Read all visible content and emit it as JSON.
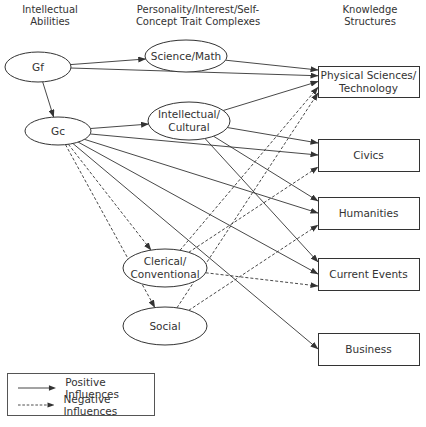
{
  "headers": {
    "abilities": [
      "Intellectual",
      "Abilities"
    ],
    "traits": [
      "Personality/Interest/Self-",
      "Concept Trait Complexes"
    ],
    "knowledge": [
      "Knowledge",
      "Structures"
    ]
  },
  "nodes": {
    "gf": {
      "label": "Gf",
      "shape": "ellipse",
      "cx": 38,
      "cy": 67,
      "rx": 33,
      "ry": 15
    },
    "gc": {
      "label": "Gc",
      "shape": "ellipse",
      "cx": 58,
      "cy": 131,
      "rx": 33,
      "ry": 14
    },
    "science_math": {
      "label": "Science/Math",
      "shape": "ellipse",
      "cx": 186,
      "cy": 56,
      "rx": 41,
      "ry": 16
    },
    "intellectual_cultural": {
      "label": "Intellectual/\nCultural",
      "line1": "Intellectual/",
      "line2": "Cultural",
      "shape": "ellipse",
      "cx": 189,
      "cy": 121,
      "rx": 41,
      "ry": 19
    },
    "clerical_conventional": {
      "label": "Clerical/\nConventional",
      "line1": "Clerical/",
      "line2": "Conventional",
      "shape": "ellipse",
      "cx": 165,
      "cy": 268,
      "rx": 42,
      "ry": 19
    },
    "social": {
      "label": "Social",
      "shape": "ellipse",
      "cx": 165,
      "cy": 326,
      "rx": 42,
      "ry": 19
    },
    "physical_sciences": {
      "label": "Physical Sciences/\nTechnology",
      "line1": "Physical Sciences/",
      "line2": "Technology",
      "shape": "box",
      "x": 318,
      "y": 66,
      "w": 101,
      "h": 31
    },
    "civics": {
      "label": "Civics",
      "shape": "box",
      "x": 318,
      "y": 139,
      "w": 101,
      "h": 32
    },
    "humanities": {
      "label": "Humanities",
      "shape": "box",
      "x": 318,
      "y": 197,
      "w": 101,
      "h": 32
    },
    "current_events": {
      "label": "Current Events",
      "shape": "box",
      "x": 318,
      "y": 258,
      "w": 101,
      "h": 32
    },
    "business": {
      "label": "Business",
      "shape": "box",
      "x": 318,
      "y": 333,
      "w": 101,
      "h": 32
    }
  },
  "edges": [
    {
      "from": "gf",
      "to": "science_math",
      "type": "positive"
    },
    {
      "from": "gf",
      "to": "physical_sciences",
      "type": "positive"
    },
    {
      "from": "gf",
      "to": "gc",
      "type": "positive"
    },
    {
      "from": "science_math",
      "to": "physical_sciences",
      "type": "positive"
    },
    {
      "from": "gc",
      "to": "intellectual_cultural",
      "type": "positive"
    },
    {
      "from": "gc",
      "to": "civics",
      "type": "positive"
    },
    {
      "from": "gc",
      "to": "humanities",
      "type": "positive"
    },
    {
      "from": "gc",
      "to": "current_events",
      "type": "positive"
    },
    {
      "from": "gc",
      "to": "business",
      "type": "positive"
    },
    {
      "from": "intellectual_cultural",
      "to": "physical_sciences",
      "type": "positive"
    },
    {
      "from": "intellectual_cultural",
      "to": "civics",
      "type": "positive"
    },
    {
      "from": "intellectual_cultural",
      "to": "humanities",
      "type": "positive"
    },
    {
      "from": "intellectual_cultural",
      "to": "current_events",
      "type": "positive"
    },
    {
      "from": "gc",
      "to": "clerical_conventional",
      "type": "negative"
    },
    {
      "from": "gc",
      "to": "social",
      "type": "negative"
    },
    {
      "from": "clerical_conventional",
      "to": "physical_sciences",
      "type": "negative"
    },
    {
      "from": "clerical_conventional",
      "to": "civics",
      "type": "negative"
    },
    {
      "from": "clerical_conventional",
      "to": "current_events",
      "type": "negative"
    },
    {
      "from": "social",
      "to": "physical_sciences",
      "type": "negative"
    },
    {
      "from": "social",
      "to": "humanities",
      "type": "negative"
    }
  ],
  "legend": {
    "positive_label": "Positive Influences",
    "negative_label": "Negative Influences"
  },
  "colors": {
    "stroke": "#333333",
    "text": "#333333",
    "background": "#ffffff"
  }
}
